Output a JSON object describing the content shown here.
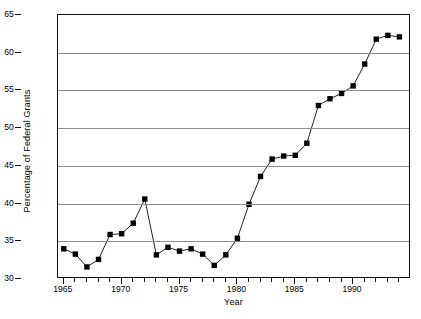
{
  "chart_data": {
    "type": "line",
    "title": "",
    "subtitle": "",
    "xlabel": "Year",
    "ylabel": "Percentage of Federal Grants",
    "xlim": [
      1964.5,
      1995.0
    ],
    "ylim": [
      30,
      65
    ],
    "ytick_labels": [
      "30",
      "35",
      "40",
      "45",
      "50",
      "55",
      "60",
      "65"
    ],
    "ytick_values": [
      30,
      35,
      40,
      45,
      50,
      55,
      60,
      65
    ],
    "xtick_labels": [
      "1965",
      "1970",
      "1975",
      "1980",
      "1985",
      "1990"
    ],
    "xtick_values": [
      1965,
      1970,
      1975,
      1980,
      1985,
      1990
    ],
    "x_minor_ticks_every": 1,
    "grid": "horizontal",
    "grid_color": "#8d8d8d",
    "legend": "none",
    "legend_position": "none",
    "marker": "filled-square",
    "marker_color": "#000000",
    "line_color": "#222222",
    "x": [
      1965,
      1966,
      1967,
      1968,
      1969,
      1970,
      1971,
      1972,
      1973,
      1974,
      1975,
      1976,
      1977,
      1978,
      1979,
      1980,
      1981,
      1982,
      1983,
      1984,
      1985,
      1986,
      1987,
      1988,
      1989,
      1990,
      1991,
      1992,
      1993,
      1994
    ],
    "values": [
      34.0,
      33.3,
      31.6,
      32.6,
      35.9,
      36.0,
      37.4,
      40.6,
      33.2,
      34.2,
      33.7,
      34.0,
      33.3,
      31.8,
      33.2,
      35.4,
      39.9,
      43.6,
      45.9,
      46.3,
      46.4,
      48.0,
      53.0,
      53.9,
      54.6,
      55.6,
      58.5,
      61.8,
      62.3,
      62.1
    ],
    "series": [
      {
        "name": "Percentage of Federal Grants",
        "values": [
          34.0,
          33.3,
          31.6,
          32.6,
          35.9,
          36.0,
          37.4,
          40.6,
          33.2,
          34.2,
          33.7,
          34.0,
          33.3,
          31.8,
          33.2,
          35.4,
          39.9,
          43.6,
          45.9,
          46.3,
          46.4,
          48.0,
          53.0,
          53.9,
          54.6,
          55.6,
          58.5,
          61.8,
          62.3,
          62.1
        ]
      }
    ]
  }
}
